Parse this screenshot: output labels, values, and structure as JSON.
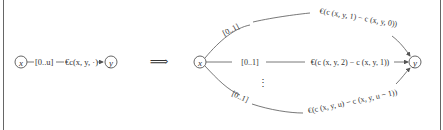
{
  "diagram": {
    "left": {
      "node_x": "x",
      "edge_label_interval": "[0..u]",
      "edge_label_cost": "€c(x, y, ·)",
      "node_y": "y"
    },
    "transform_arrow": "⟹",
    "right": {
      "node_x": "x",
      "node_y": "y",
      "edges": [
        {
          "interval": "[0..1]",
          "cost": "€(c (x, y, 1) − c (x, y, 0))"
        },
        {
          "interval": "[0..1]",
          "cost": "€(c (x, y, 2) − c (x, y, 1))"
        },
        {
          "interval": "[0..1]",
          "cost": "€(c (x, y, u) − c (x, y, u − 1))"
        }
      ],
      "ellipsis": "⋮"
    }
  },
  "colors": {
    "stroke": "#555555",
    "text": "#333333",
    "frame": "#666666"
  }
}
